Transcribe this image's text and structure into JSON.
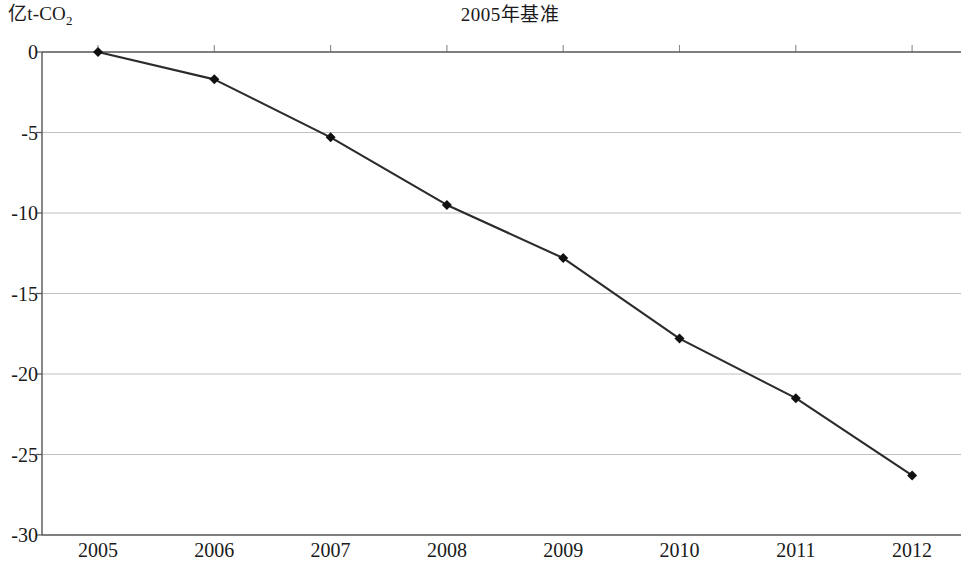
{
  "chart_data": {
    "type": "line",
    "title": "2005年基准",
    "ylabel": "亿t-CO",
    "ylabel_sub": "2",
    "xlabel": "",
    "categories": [
      "2005",
      "2006",
      "2007",
      "2008",
      "2009",
      "2010",
      "2011",
      "2012"
    ],
    "x": [
      2005,
      2006,
      2007,
      2008,
      2009,
      2010,
      2011,
      2012
    ],
    "series": [
      {
        "name": "2005年基准",
        "values": [
          0,
          -1.7,
          -5.3,
          -9.5,
          -12.8,
          -17.8,
          -21.5,
          -26.3
        ]
      }
    ],
    "ylim": [
      -30,
      0
    ],
    "yticks": [
      0,
      -5,
      -10,
      -15,
      -20,
      -25,
      -30
    ],
    "ytick_labels": [
      "0",
      "-5",
      "-10",
      "-15",
      "-20",
      "-25",
      "-30"
    ],
    "grid": true,
    "grid_axis": "y",
    "legend": false,
    "marker": "diamond",
    "line_color": "#2b2b2b",
    "marker_color": "#111111",
    "grid_color": "#b8b8b8",
    "axis_color": "#6f6f6f",
    "background": "#ffffff"
  }
}
